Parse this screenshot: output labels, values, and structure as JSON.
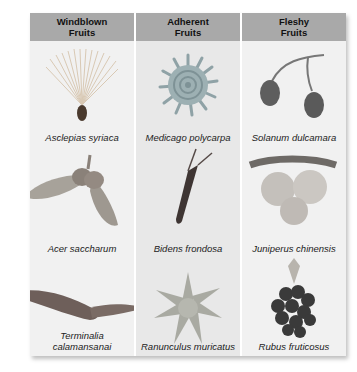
{
  "columns": [
    {
      "header_line1": "Windblown",
      "header_line2": "Fruits",
      "items": [
        {
          "name": "Asclepias syriaca",
          "icon": "milkweed-seed-icon"
        },
        {
          "name": "Acer saccharum",
          "icon": "maple-samara-icon"
        },
        {
          "name": "Terminalia calamansanai",
          "icon": "winged-fruit-icon"
        }
      ]
    },
    {
      "header_line1": "Adherent",
      "header_line2": "Fruits",
      "items": [
        {
          "name": "Medicago polycarpa",
          "icon": "spiral-burr-icon"
        },
        {
          "name": "Bidens frondosa",
          "icon": "beggar-tick-icon"
        },
        {
          "name": "Ranunculus muricatus",
          "icon": "spiny-achene-icon"
        }
      ]
    },
    {
      "header_line1": "Fleshy",
      "header_line2": "Fruits",
      "items": [
        {
          "name": "Solanum dulcamara",
          "icon": "berries-icon"
        },
        {
          "name": "Juniperus chinensis",
          "icon": "juniper-cones-icon"
        },
        {
          "name": "Rubus fruticosus",
          "icon": "blackberry-icon"
        }
      ]
    }
  ],
  "colors": {
    "header_bg": "#a9a9a9",
    "cell_bg_light": "#f1f1f1",
    "cell_bg_mid": "#e8e8e8"
  }
}
